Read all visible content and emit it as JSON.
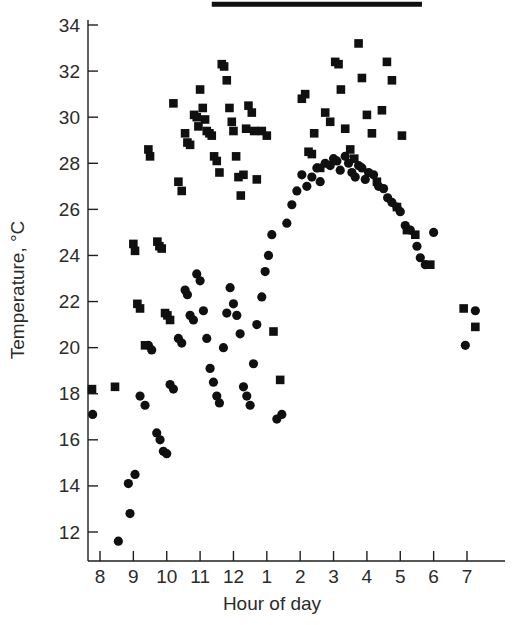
{
  "chart_data": {
    "type": "scatter",
    "title": "",
    "xlabel": "Hour of day",
    "ylabel": "Temperature, °C",
    "grid": false,
    "legend_position": "none",
    "x_tick_labels": [
      "8",
      "9",
      "10",
      "11",
      "12",
      "1",
      "2",
      "3",
      "4",
      "5",
      "6",
      "7"
    ],
    "x_tick_hours": [
      8,
      9,
      10,
      11,
      12,
      13,
      14,
      15,
      16,
      17,
      18,
      19
    ],
    "y_tick_labels": [
      "12",
      "14",
      "16",
      "18",
      "20",
      "22",
      "24",
      "26",
      "28",
      "30",
      "32",
      "34"
    ],
    "y_ticks": [
      12,
      14,
      16,
      18,
      20,
      22,
      24,
      26,
      28,
      30,
      32,
      34
    ],
    "xlim": [
      7.6,
      19.6
    ],
    "ylim": [
      11.2,
      34.4
    ],
    "annotations": [
      {
        "name": "daylight-period-bar",
        "type": "horizontal-bar",
        "x_start": 11.35,
        "x_end": 17.65,
        "y": 34.9
      }
    ],
    "series": [
      {
        "name": "squares",
        "marker": "square",
        "color": "#101010",
        "points": [
          [
            7.76,
            18.2
          ],
          [
            8.45,
            18.3
          ],
          [
            9.0,
            24.5
          ],
          [
            9.05,
            24.2
          ],
          [
            9.12,
            21.9
          ],
          [
            9.2,
            21.7
          ],
          [
            9.35,
            20.1
          ],
          [
            9.45,
            28.6
          ],
          [
            9.5,
            28.3
          ],
          [
            9.72,
            24.6
          ],
          [
            9.78,
            24.4
          ],
          [
            9.85,
            24.3
          ],
          [
            9.95,
            21.5
          ],
          [
            10.02,
            21.4
          ],
          [
            10.1,
            21.2
          ],
          [
            10.2,
            30.6
          ],
          [
            10.35,
            27.2
          ],
          [
            10.45,
            26.8
          ],
          [
            10.55,
            29.3
          ],
          [
            10.62,
            28.9
          ],
          [
            10.7,
            28.8
          ],
          [
            10.82,
            30.1
          ],
          [
            10.9,
            30.0
          ],
          [
            10.95,
            29.6
          ],
          [
            11.0,
            31.2
          ],
          [
            11.08,
            30.4
          ],
          [
            11.15,
            29.9
          ],
          [
            11.2,
            29.4
          ],
          [
            11.28,
            29.3
          ],
          [
            11.35,
            29.2
          ],
          [
            11.42,
            28.3
          ],
          [
            11.5,
            28.1
          ],
          [
            11.58,
            27.6
          ],
          [
            11.65,
            32.3
          ],
          [
            11.72,
            32.2
          ],
          [
            11.8,
            31.6
          ],
          [
            11.88,
            30.4
          ],
          [
            11.95,
            29.8
          ],
          [
            12.0,
            29.4
          ],
          [
            12.08,
            28.3
          ],
          [
            12.15,
            27.4
          ],
          [
            12.22,
            26.6
          ],
          [
            12.3,
            27.5
          ],
          [
            12.38,
            29.5
          ],
          [
            12.45,
            30.5
          ],
          [
            12.55,
            30.2
          ],
          [
            12.62,
            29.4
          ],
          [
            12.7,
            27.3
          ],
          [
            12.85,
            29.4
          ],
          [
            13.0,
            29.2
          ],
          [
            13.2,
            20.7
          ],
          [
            13.4,
            18.6
          ],
          [
            14.05,
            30.8
          ],
          [
            14.15,
            31.0
          ],
          [
            14.25,
            28.5
          ],
          [
            14.35,
            28.4
          ],
          [
            14.42,
            29.3
          ],
          [
            14.6,
            27.8
          ],
          [
            14.75,
            30.2
          ],
          [
            14.9,
            29.8
          ],
          [
            15.05,
            32.4
          ],
          [
            15.15,
            32.3
          ],
          [
            15.22,
            31.2
          ],
          [
            15.35,
            29.5
          ],
          [
            15.5,
            28.6
          ],
          [
            15.62,
            28.2
          ],
          [
            15.75,
            33.2
          ],
          [
            15.85,
            31.7
          ],
          [
            16.0,
            30.1
          ],
          [
            16.15,
            29.3
          ],
          [
            16.3,
            27.2
          ],
          [
            16.45,
            30.3
          ],
          [
            16.6,
            32.4
          ],
          [
            16.75,
            31.6
          ],
          [
            16.9,
            26.1
          ],
          [
            17.05,
            29.2
          ],
          [
            17.2,
            25.1
          ],
          [
            17.45,
            24.9
          ],
          [
            17.9,
            23.6
          ],
          [
            18.9,
            21.7
          ],
          [
            19.25,
            20.9
          ]
        ]
      },
      {
        "name": "circles",
        "marker": "circle",
        "color": "#101010",
        "points": [
          [
            7.78,
            17.1
          ],
          [
            8.55,
            11.6
          ],
          [
            8.85,
            14.1
          ],
          [
            8.9,
            12.8
          ],
          [
            9.05,
            14.5
          ],
          [
            9.2,
            17.9
          ],
          [
            9.35,
            17.5
          ],
          [
            9.45,
            20.1
          ],
          [
            9.55,
            19.9
          ],
          [
            9.7,
            16.3
          ],
          [
            9.8,
            16.0
          ],
          [
            9.9,
            15.5
          ],
          [
            10.0,
            15.4
          ],
          [
            10.1,
            18.4
          ],
          [
            10.2,
            18.2
          ],
          [
            10.35,
            20.4
          ],
          [
            10.45,
            20.2
          ],
          [
            10.55,
            22.5
          ],
          [
            10.62,
            22.3
          ],
          [
            10.7,
            21.4
          ],
          [
            10.8,
            21.2
          ],
          [
            10.9,
            23.2
          ],
          [
            11.0,
            22.9
          ],
          [
            11.1,
            21.6
          ],
          [
            11.2,
            20.4
          ],
          [
            11.3,
            19.1
          ],
          [
            11.4,
            18.5
          ],
          [
            11.5,
            17.9
          ],
          [
            11.58,
            17.6
          ],
          [
            11.7,
            20.0
          ],
          [
            11.8,
            21.5
          ],
          [
            11.9,
            22.6
          ],
          [
            12.0,
            21.9
          ],
          [
            12.1,
            21.4
          ],
          [
            12.2,
            20.6
          ],
          [
            12.3,
            18.3
          ],
          [
            12.4,
            17.9
          ],
          [
            12.5,
            17.5
          ],
          [
            12.6,
            19.3
          ],
          [
            12.7,
            21.0
          ],
          [
            12.85,
            22.2
          ],
          [
            12.95,
            23.3
          ],
          [
            13.05,
            24.0
          ],
          [
            13.15,
            24.9
          ],
          [
            13.3,
            16.9
          ],
          [
            13.45,
            17.1
          ],
          [
            13.6,
            25.4
          ],
          [
            13.75,
            26.2
          ],
          [
            13.9,
            26.8
          ],
          [
            14.05,
            27.5
          ],
          [
            14.2,
            27.0
          ],
          [
            14.35,
            27.4
          ],
          [
            14.5,
            27.8
          ],
          [
            14.6,
            27.2
          ],
          [
            14.75,
            28.0
          ],
          [
            14.9,
            27.9
          ],
          [
            15.0,
            28.2
          ],
          [
            15.1,
            28.1
          ],
          [
            15.2,
            27.7
          ],
          [
            15.35,
            28.3
          ],
          [
            15.45,
            28.0
          ],
          [
            15.55,
            27.6
          ],
          [
            15.65,
            27.4
          ],
          [
            15.75,
            27.9
          ],
          [
            15.85,
            27.8
          ],
          [
            15.95,
            27.3
          ],
          [
            16.05,
            27.6
          ],
          [
            16.2,
            27.5
          ],
          [
            16.35,
            27.0
          ],
          [
            16.5,
            26.9
          ],
          [
            16.62,
            26.5
          ],
          [
            16.75,
            26.3
          ],
          [
            16.9,
            26.1
          ],
          [
            17.0,
            25.9
          ],
          [
            17.15,
            25.3
          ],
          [
            17.3,
            25.1
          ],
          [
            17.5,
            24.4
          ],
          [
            17.6,
            23.9
          ],
          [
            17.75,
            23.6
          ],
          [
            18.0,
            25.0
          ],
          [
            18.95,
            20.1
          ],
          [
            19.25,
            21.6
          ]
        ]
      }
    ]
  },
  "axes": {
    "y_axis_title": "Temperature, °C",
    "x_axis_title": "Hour of day"
  }
}
